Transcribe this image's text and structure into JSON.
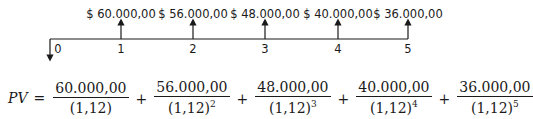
{
  "timeline": {
    "periods": [
      "0",
      "1",
      "2",
      "3",
      "4",
      "5"
    ],
    "cash_flows": [
      "$ 60.000,00",
      "$ 56.000,00",
      "$ 48.000,00",
      "$ 40.000,00",
      "$ 36.000,00"
    ],
    "line_color": "#1a1a1a"
  },
  "formula": {
    "lhs": "PV",
    "equals": "=",
    "plus": "+",
    "terms": [
      {
        "numerator": "60.000,00",
        "denominator": "(1,12)",
        "exponent": ""
      },
      {
        "numerator": "56.000,00",
        "denominator": "(1,12)",
        "exponent": "2"
      },
      {
        "numerator": "48.000,00",
        "denominator": "(1,12)",
        "exponent": "3"
      },
      {
        "numerator": "40.000,00",
        "denominator": "(1,12)",
        "exponent": "4"
      },
      {
        "numerator": "36.000,00",
        "denominator": "(1,12)",
        "exponent": "5"
      }
    ]
  }
}
